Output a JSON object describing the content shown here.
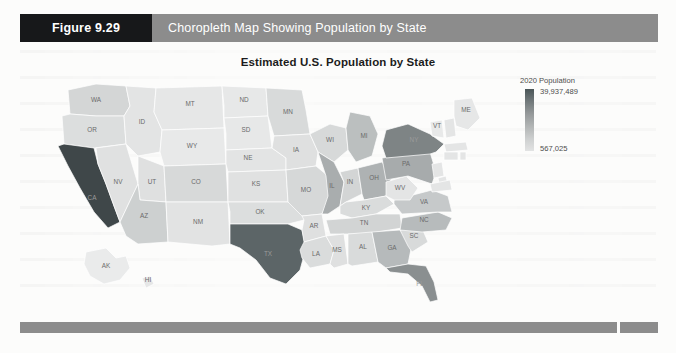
{
  "figure": {
    "number_label": "Figure 9.29",
    "caption": "Choropleth Map Showing Population by State"
  },
  "chart_data": {
    "type": "choropleth",
    "title": "Estimated U.S. Population by State",
    "legend_title": "2020 Population",
    "legend_max_label": "39,937,489",
    "legend_min_label": "567,025",
    "value_min": 567025,
    "value_max": 39937489,
    "colorbar": {
      "orientation": "vertical",
      "high_color": "#4a5557",
      "low_color": "#e2e3e3"
    },
    "units": "people",
    "year": 2020,
    "regions": [
      {
        "code": "WA",
        "value": 7797095,
        "fill": "#d4d6d6"
      },
      {
        "code": "OR",
        "value": 4301089,
        "fill": "#dcdede"
      },
      {
        "code": "CA",
        "value": 39937489,
        "fill": "#3f4749"
      },
      {
        "code": "NV",
        "value": 3139658,
        "fill": "#e0e1e1"
      },
      {
        "code": "ID",
        "value": 1826156,
        "fill": "#e3e4e4"
      },
      {
        "code": "MT",
        "value": 1086759,
        "fill": "#e6e7e7"
      },
      {
        "code": "WY",
        "value": 567025,
        "fill": "#e8e9e9"
      },
      {
        "code": "UT",
        "value": 3282115,
        "fill": "#dfe0e0"
      },
      {
        "code": "AZ",
        "value": 7378494,
        "fill": "#cdd0d0"
      },
      {
        "code": "CO",
        "value": 5845526,
        "fill": "#d7d9d9"
      },
      {
        "code": "NM",
        "value": 2096640,
        "fill": "#e2e3e3"
      },
      {
        "code": "ND",
        "value": 761723,
        "fill": "#e7e8e8"
      },
      {
        "code": "SD",
        "value": 903027,
        "fill": "#e7e8e8"
      },
      {
        "code": "NE",
        "value": 1952570,
        "fill": "#e3e4e4"
      },
      {
        "code": "KS",
        "value": 2910357,
        "fill": "#e0e1e1"
      },
      {
        "code": "OK",
        "value": 3954821,
        "fill": "#dcdede"
      },
      {
        "code": "TX",
        "value": 29472295,
        "fill": "#5c6567"
      },
      {
        "code": "MN",
        "value": 5700671,
        "fill": "#d8dada"
      },
      {
        "code": "IA",
        "value": 3179849,
        "fill": "#dfe0e0"
      },
      {
        "code": "MO",
        "value": 6169270,
        "fill": "#d6d8d8"
      },
      {
        "code": "AR",
        "value": 3038999,
        "fill": "#dfe0e0"
      },
      {
        "code": "LA",
        "value": 4645184,
        "fill": "#dadcdc"
      },
      {
        "code": "WI",
        "value": 5851754,
        "fill": "#d7d9d9"
      },
      {
        "code": "IL",
        "value": 12659682,
        "fill": "#a9adae"
      },
      {
        "code": "MI",
        "value": 10045029,
        "fill": "#bbbfbf"
      },
      {
        "code": "IN",
        "value": 6745354,
        "fill": "#d3d5d5"
      },
      {
        "code": "OH",
        "value": 11747694,
        "fill": "#aeb2b3"
      },
      {
        "code": "KY",
        "value": 4499692,
        "fill": "#dadcdc"
      },
      {
        "code": "TN",
        "value": 6897576,
        "fill": "#d2d4d4"
      },
      {
        "code": "MS",
        "value": 2989260,
        "fill": "#dfe0e0"
      },
      {
        "code": "AL",
        "value": 4908621,
        "fill": "#d9dbdb"
      },
      {
        "code": "GA",
        "value": 10736059,
        "fill": "#b6babb"
      },
      {
        "code": "FL",
        "value": 21992985,
        "fill": "#8a8f90"
      },
      {
        "code": "SC",
        "value": 5210095,
        "fill": "#d8dada"
      },
      {
        "code": "NC",
        "value": 10611862,
        "fill": "#b7bbbc"
      },
      {
        "code": "VA",
        "value": 8626207,
        "fill": "#c6c9ca"
      },
      {
        "code": "WV",
        "value": 1778070,
        "fill": "#e4e5e5"
      },
      {
        "code": "PA",
        "value": 12820878,
        "fill": "#a7abac"
      },
      {
        "code": "NY",
        "value": 19440469,
        "fill": "#7e8485"
      },
      {
        "code": "VT",
        "value": 628061,
        "fill": "#e8e9e9"
      },
      {
        "code": "ME",
        "value": 1345790,
        "fill": "#e6e7e7"
      },
      {
        "code": "AK",
        "value": 734002,
        "fill": "#eaebeb"
      },
      {
        "code": "HI",
        "value": 1412687,
        "fill": "#e6e7e7"
      }
    ]
  },
  "bottom_rule": {
    "visible": true
  }
}
